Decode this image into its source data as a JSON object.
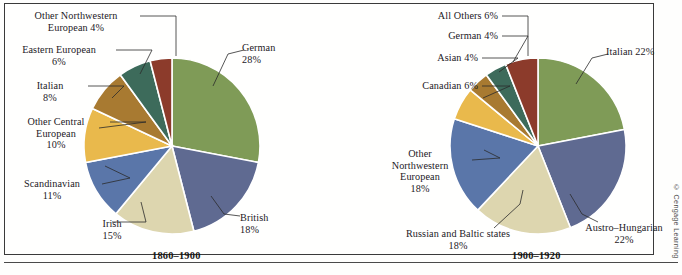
{
  "figure": {
    "credit": "© Cengage Learning"
  },
  "charts": [
    {
      "id": "pie-1860-1900",
      "caption": "1860–1900",
      "caption_x": 152,
      "caption_y": 250,
      "cx": 172,
      "cy": 146,
      "r": 88,
      "labels": [
        {
          "text": "Other Northwestern\nEuropean 4%",
          "x": 14,
          "y": 10,
          "w": 124,
          "align": "center-al",
          "leader": [
            [
              140,
              16
            ],
            [
              176,
              16
            ],
            [
              176,
              56
            ]
          ]
        },
        {
          "text": "Eastern European\n6%",
          "x": 4,
          "y": 44,
          "w": 110,
          "align": "center-al",
          "leader": [
            [
              116,
              50
            ],
            [
              152,
              50
            ],
            [
              140,
              74
            ]
          ]
        },
        {
          "text": "Italian\n8%",
          "x": 14,
          "y": 80,
          "w": 72,
          "align": "center-al",
          "leader": [
            [
              88,
              86
            ],
            [
              124,
              86
            ],
            [
              112,
              98
            ]
          ]
        },
        {
          "text": "Other Central\nEuropean\n10%",
          "x": 4,
          "y": 116,
          "w": 104,
          "align": "center-al",
          "leader": [
            [
              110,
              122
            ],
            [
              146,
              122
            ],
            [
              99,
              128
            ]
          ]
        },
        {
          "text": "Scandinavian\n11%",
          "x": 4,
          "y": 178,
          "w": 96,
          "align": "center-al",
          "leader": [
            [
              102,
              184
            ],
            [
              130,
              178
            ],
            [
              105,
              166
            ]
          ]
        },
        {
          "text": "Irish\n15%",
          "x": 80,
          "y": 218,
          "w": 64,
          "align": "center-al",
          "leader": [
            [
              112,
              222
            ],
            [
              146,
              222
            ],
            [
              141,
              202
            ]
          ]
        },
        {
          "text": "German\n28%",
          "x": 242,
          "y": 42,
          "w": 74,
          "align": "left-al",
          "leader": [
            [
              244,
              50
            ],
            [
              228,
              54
            ],
            [
              213,
              86
            ]
          ]
        },
        {
          "text": "British\n18%",
          "x": 240,
          "y": 212,
          "w": 70,
          "align": "left-al",
          "leader": [
            [
              240,
              216
            ],
            [
              224,
              214
            ],
            [
              211,
              196
            ]
          ]
        }
      ],
      "chart_data": {
        "type": "pie",
        "title": "1860–1900",
        "legend": "labels on slices",
        "start_angle_deg": 0,
        "direction": "clockwise",
        "categories": [
          "German",
          "British",
          "Irish",
          "Scandinavian",
          "Other Central European",
          "Italian",
          "Eastern European",
          "Other Northwestern European"
        ],
        "values": [
          28,
          18,
          15,
          11,
          10,
          8,
          6,
          4
        ],
        "unit": "%",
        "colors": [
          "#7f9b57",
          "#5f6a91",
          "#ddd6af",
          "#5a76a9",
          "#e9b94c",
          "#a87a31",
          "#3d6b5b",
          "#8c3b2b"
        ]
      }
    },
    {
      "id": "pie-1900-1920",
      "caption": "1900–1920",
      "caption_x": 512,
      "caption_y": 250,
      "cx": 538,
      "cy": 146,
      "r": 88,
      "labels": [
        {
          "text": "All Others 6%",
          "x": 388,
          "y": 10,
          "w": 110,
          "align": "right-al",
          "leader": [
            [
              502,
              16
            ],
            [
              528,
              16
            ],
            [
              528,
              56
            ]
          ]
        },
        {
          "text": "German 4%",
          "x": 388,
          "y": 30,
          "w": 110,
          "align": "right-al",
          "leader": [
            [
              502,
              36
            ],
            [
              528,
              36
            ],
            [
              513,
              62
            ]
          ]
        },
        {
          "text": "Asian 4%",
          "x": 378,
          "y": 52,
          "w": 100,
          "align": "right-al",
          "leader": [
            [
              482,
              58
            ],
            [
              518,
              58
            ],
            [
              499,
              72
            ]
          ]
        },
        {
          "text": "Canadian 6%",
          "x": 368,
          "y": 80,
          "w": 110,
          "align": "right-al",
          "leader": [
            [
              482,
              86
            ],
            [
              510,
              86
            ],
            [
              483,
              98
            ]
          ]
        },
        {
          "text": "Other\nNorthwestern\nEuropean\n18%",
          "x": 370,
          "y": 148,
          "w": 100,
          "align": "center-al",
          "leader": [
            [
              472,
              160
            ],
            [
              500,
              158
            ],
            [
              484,
              150
            ]
          ]
        },
        {
          "text": "Russian and Baltic states\n18%",
          "x": 378,
          "y": 228,
          "w": 160,
          "align": "center-al",
          "leader": [
            [
              494,
              228
            ],
            [
              520,
              204
            ],
            [
              523,
              190
            ]
          ]
        },
        {
          "text": "Italian 22%",
          "x": 606,
          "y": 46,
          "w": 76,
          "align": "left-al",
          "leader": [
            [
              608,
              54
            ],
            [
              592,
              58
            ],
            [
              576,
              84
            ]
          ]
        },
        {
          "text": "Austro–Hungarian\n22%",
          "x": 570,
          "y": 222,
          "w": 108,
          "align": "center-al",
          "leader": [
            [
              598,
              222
            ],
            [
              582,
              214
            ],
            [
              570,
              194
            ]
          ]
        }
      ],
      "chart_data": {
        "type": "pie",
        "title": "1900–1920",
        "legend": "labels on slices",
        "start_angle_deg": 0,
        "direction": "clockwise",
        "categories": [
          "Italian",
          "Austro–Hungarian",
          "Russian and Baltic states",
          "Other Northwestern European",
          "Canadian",
          "Asian",
          "German",
          "All Others"
        ],
        "values": [
          22,
          22,
          18,
          18,
          6,
          4,
          4,
          6
        ],
        "unit": "%",
        "colors": [
          "#7f9b57",
          "#5f6a91",
          "#ddd6af",
          "#5a76a9",
          "#e9b94c",
          "#a87a31",
          "#3d6b5b",
          "#8c3b2b"
        ]
      }
    }
  ]
}
